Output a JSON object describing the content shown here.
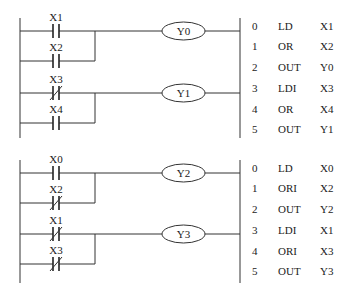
{
  "diagram": {
    "type": "plc-ladder-with-instruction-list",
    "sections": [
      {
        "id": "top",
        "rungs": [
          {
            "coil": "Y0",
            "contacts": [
              {
                "label": "X1",
                "type": "NO",
                "branch": "series"
              },
              {
                "label": "X2",
                "type": "NO",
                "branch": "parallel"
              }
            ]
          },
          {
            "coil": "Y1",
            "contacts": [
              {
                "label": "X3",
                "type": "NC",
                "branch": "series"
              },
              {
                "label": "X4",
                "type": "NO",
                "branch": "parallel"
              }
            ]
          }
        ],
        "instructions": [
          {
            "step": "0",
            "op": "LD",
            "operand": "X1"
          },
          {
            "step": "1",
            "op": "OR",
            "operand": "X2"
          },
          {
            "step": "2",
            "op": "OUT",
            "operand": "Y0"
          },
          {
            "step": "3",
            "op": "LDI",
            "operand": "X3"
          },
          {
            "step": "4",
            "op": "OR",
            "operand": "X4"
          },
          {
            "step": "5",
            "op": "OUT",
            "operand": "Y1"
          }
        ]
      },
      {
        "id": "bottom",
        "rungs": [
          {
            "coil": "Y2",
            "contacts": [
              {
                "label": "X0",
                "type": "NO",
                "branch": "series"
              },
              {
                "label": "X2",
                "type": "NC",
                "branch": "parallel"
              }
            ]
          },
          {
            "coil": "Y3",
            "contacts": [
              {
                "label": "X1",
                "type": "NC",
                "branch": "series"
              },
              {
                "label": "X3",
                "type": "NC",
                "branch": "parallel"
              }
            ]
          }
        ],
        "instructions": [
          {
            "step": "0",
            "op": "LD",
            "operand": "X0"
          },
          {
            "step": "1",
            "op": "ORI",
            "operand": "X2"
          },
          {
            "step": "2",
            "op": "OUT",
            "operand": "Y2"
          },
          {
            "step": "3",
            "op": "LDI",
            "operand": "X1"
          },
          {
            "step": "4",
            "op": "ORI",
            "operand": "X3"
          },
          {
            "step": "5",
            "op": "OUT",
            "operand": "Y3"
          }
        ]
      }
    ]
  }
}
